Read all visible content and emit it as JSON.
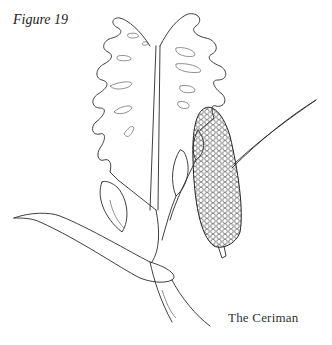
{
  "figure": {
    "label": "Figure 19",
    "caption": "The Ceriman"
  },
  "style": {
    "background": "#ffffff",
    "ink": "#2a2a2a"
  }
}
